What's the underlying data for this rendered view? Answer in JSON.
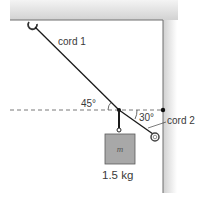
{
  "diagram": {
    "type": "physics-statics",
    "labels": {
      "cord1": "cord 1",
      "cord2": "cord 2",
      "angle1": "45°",
      "angle2": "30°",
      "mass_symbol": "m",
      "mass_value": "1.5 kg"
    },
    "colors": {
      "surface": "#d9d9d9",
      "surface_edge": "#6e6e6e",
      "cord": "#1a1a1a",
      "block_fill": "#a8a8a8",
      "block_edge": "#5a5a5a",
      "dashed_line": "#555555",
      "text": "#3a3a3a"
    }
  }
}
